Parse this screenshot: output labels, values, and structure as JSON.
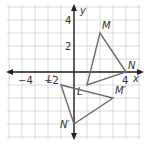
{
  "diagram": {
    "type": "coordinate-plane",
    "origin_px": [
      74,
      72
    ],
    "unit_px": 13,
    "range": {
      "x": [
        -5,
        5
      ],
      "y": [
        -5,
        5
      ]
    },
    "axis_labels": {
      "x": "x",
      "y": "y"
    },
    "tick_labels": {
      "x": [
        {
          "value": -4,
          "text": "−4"
        },
        {
          "value": -2,
          "text": "−2"
        },
        {
          "value": 4,
          "text": "4"
        }
      ],
      "y": [
        {
          "value": 4,
          "text": "4"
        },
        {
          "value": 2,
          "text": "2"
        }
      ]
    },
    "triangles": [
      {
        "name": "LMN",
        "vertices": [
          {
            "label": "L",
            "x": 1,
            "y": -1
          },
          {
            "label": "M",
            "x": 2,
            "y": 3
          },
          {
            "label": "N",
            "x": 4,
            "y": 0
          }
        ]
      },
      {
        "name": "L'M'N'",
        "vertices": [
          {
            "label": "L′",
            "x": -1,
            "y": -1
          },
          {
            "label": "M′",
            "x": 3,
            "y": -2
          },
          {
            "label": "N′",
            "x": 0,
            "y": -4
          }
        ]
      }
    ],
    "colors": {
      "grid": "#cfcfcf",
      "axis": "#222222",
      "triangle": "#6b6b6b"
    }
  }
}
